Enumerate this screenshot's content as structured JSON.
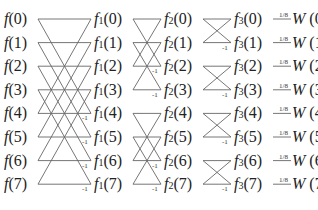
{
  "colors": {
    "line": "#666666",
    "text": "#222222"
  },
  "columns": [
    {
      "name": "input",
      "func": "f",
      "subscript": "",
      "labels": [
        "0",
        "1",
        "2",
        "3",
        "4",
        "5",
        "6",
        "7"
      ]
    },
    {
      "name": "stage1",
      "func": "f",
      "subscript": "1",
      "labels": [
        "0",
        "1",
        "2",
        "3",
        "4",
        "5",
        "6",
        "7"
      ]
    },
    {
      "name": "stage2",
      "func": "f",
      "subscript": "2",
      "labels": [
        "0",
        "1",
        "2",
        "3",
        "4",
        "5",
        "6",
        "7"
      ]
    },
    {
      "name": "stage3",
      "func": "f",
      "subscript": "3",
      "labels": [
        "0",
        "1",
        "2",
        "3",
        "4",
        "5",
        "6",
        "7"
      ]
    },
    {
      "name": "output",
      "func": "W",
      "subscript": "",
      "labels": [
        "0",
        "1",
        "2",
        "3",
        "4",
        "5",
        "6",
        "7"
      ]
    }
  ],
  "stages": [
    {
      "span": 4,
      "negative_label": "-1"
    },
    {
      "span": 2,
      "negative_label": "-1"
    },
    {
      "span": 1,
      "negative_label": "-1"
    }
  ],
  "output_weight": "1/8"
}
